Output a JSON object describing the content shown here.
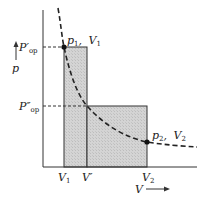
{
  "diagram": {
    "axes": {
      "y_label": "p",
      "x_label": "V"
    },
    "pressure_ticks": [
      {
        "label": "P",
        "prime": "′",
        "sub": "op",
        "y": 47
      },
      {
        "label": "P",
        "prime": "″",
        "sub": "op",
        "y": 106
      }
    ],
    "volume_ticks": [
      {
        "label": "V",
        "sub": "1",
        "x": 64
      },
      {
        "label": "V",
        "prime": "′",
        "x": 87
      },
      {
        "label": "V",
        "sub": "2",
        "x": 147
      }
    ],
    "points": [
      {
        "name": "p",
        "sub": "1",
        "vname": "V",
        "vsub": "1",
        "x": 64,
        "y": 47
      },
      {
        "name": "p",
        "sub": "2",
        "vname": "V",
        "vsub": "2",
        "x": 147,
        "y": 142
      }
    ],
    "colors": {
      "shade": "#cfcfcf",
      "line": "#222222"
    }
  }
}
